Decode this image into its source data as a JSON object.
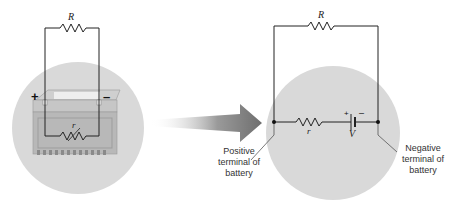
{
  "left_figure": {
    "external_resistor_label": "R",
    "internal_resistor_label": "r",
    "positive_sign": "+",
    "negative_sign": "–"
  },
  "right_figure": {
    "external_resistor_label": "R",
    "internal_resistor_label": "r",
    "emf_label": "V",
    "battery_plus": "+",
    "battery_minus": "–",
    "positive_terminal_label": [
      "Positive",
      "terminal of",
      "battery"
    ],
    "negative_terminal_label": [
      "Negative",
      "terminal of",
      "battery"
    ]
  },
  "colors": {
    "circle_fill": "#d9d9d9",
    "wire": "#222222",
    "arrow": "#777777",
    "battery_body": "#b8b8b8"
  }
}
